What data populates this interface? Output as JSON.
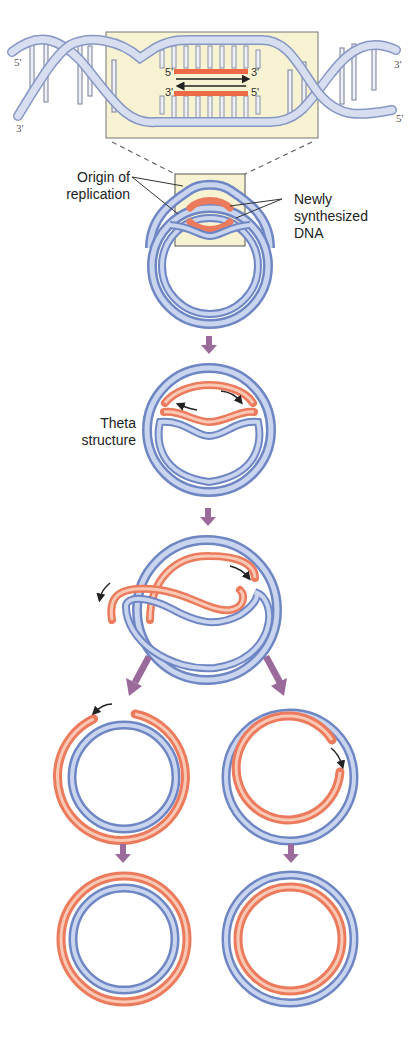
{
  "diagram": {
    "type": "DNA theta replication of circular chromosome",
    "colors": {
      "parental_strand": "#6f86c4",
      "parental_strand_light": "#c9d4ee",
      "new_strand": "#ec7a5c",
      "new_strand_light": "#f9c9b6",
      "arrow": "#9a6a9a",
      "inset_background": "#f6f2d2",
      "helix": "#b9c6e2"
    },
    "helix_inset": {
      "left_end_top": "5'",
      "left_end_bottom": "3'",
      "right_end_top": "3'",
      "right_end_bottom": "5'",
      "upper_new_strand_left": "5'",
      "upper_new_strand_right": "3'",
      "lower_new_strand_left": "3'",
      "lower_new_strand_right": "5'"
    },
    "labels": {
      "origin_line1": "Origin of",
      "origin_line2": "replication",
      "newly_line1": "Newly",
      "newly_line2": "synthesized",
      "newly_line3": "DNA",
      "theta_line1": "Theta",
      "theta_line2": "structure"
    },
    "stages": [
      {
        "id": "origin",
        "description": "Replication bubble at origin"
      },
      {
        "id": "theta",
        "description": "Theta structure"
      },
      {
        "id": "nearly-complete",
        "description": "Replication forks progressing"
      },
      {
        "id": "separated-left",
        "description": "Daughter circle with new outer strand"
      },
      {
        "id": "separated-right",
        "description": "Daughter circle with new inner strand"
      },
      {
        "id": "final-left",
        "description": "Completed daughter molecule"
      },
      {
        "id": "final-right",
        "description": "Completed daughter molecule"
      }
    ]
  }
}
